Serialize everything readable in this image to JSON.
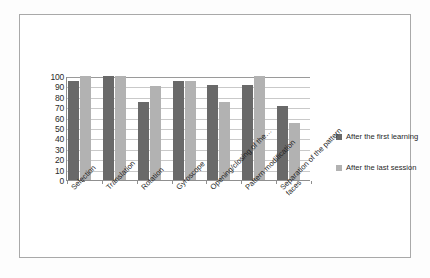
{
  "chart_data": {
    "type": "bar",
    "title": "",
    "xlabel": "",
    "ylabel": "",
    "ylim": [
      0,
      100
    ],
    "ytick_step": 10,
    "yticks": [
      "100",
      "90",
      "80",
      "70",
      "60",
      "50",
      "40",
      "30",
      "20",
      "10",
      "0"
    ],
    "grid": true,
    "legend_position": "right",
    "categories": [
      "Selection",
      "Translation",
      "Rotation",
      "Gyroscope",
      "Opening/closing of the…",
      "Pattern modification",
      "Separation of the pattern\nfaces"
    ],
    "series": [
      {
        "name": "After the first learning",
        "color": "#696969",
        "values": [
          95,
          100,
          75,
          95,
          91,
          91,
          71
        ]
      },
      {
        "name": "After the last session",
        "color": "#b2b2b2",
        "values": [
          100,
          100,
          90,
          95,
          75,
          100,
          55
        ]
      }
    ]
  },
  "legend": {
    "items": [
      {
        "label": "After the first learning",
        "color": "#696969"
      },
      {
        "label": "After the last session",
        "color": "#b2b2b2"
      }
    ]
  },
  "colors": {
    "series_1": "#696969",
    "series_2": "#b2b2b2",
    "axis": "#8f8f8f",
    "grid": "#c9c9c9",
    "frame_border": "#a9a9a9",
    "text": "#1f1f1f"
  }
}
